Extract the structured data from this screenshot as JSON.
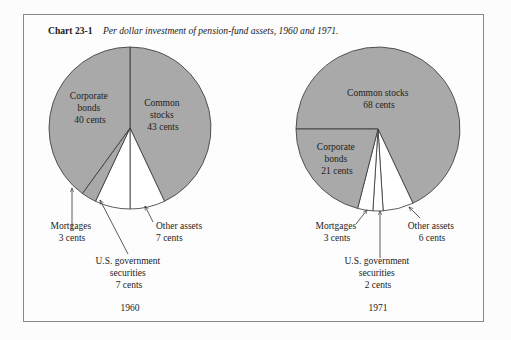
{
  "header": {
    "chart_number": "Chart 23-1",
    "caption": "Per dollar investment of pension-fund assets, 1960 and 1971."
  },
  "colors": {
    "shaded": "#a9a9a9",
    "unshaded": "#ffffff",
    "stroke": "#333333",
    "frame": "#888888"
  },
  "chart_data": [
    {
      "type": "pie",
      "title": "1960",
      "unit": "cents per dollar",
      "categories": [
        "Common stocks",
        "Other assets",
        "U.S. government securities",
        "Mortgages",
        "Corporate bonds"
      ],
      "values": [
        43,
        7,
        7,
        3,
        40
      ],
      "shaded": [
        true,
        false,
        false,
        true,
        true
      ],
      "labels": {
        "common_stocks": [
          "Common",
          "stocks",
          "43 cents"
        ],
        "corporate_bonds": [
          "Corporate",
          "bonds",
          "40 cents"
        ],
        "mortgages": [
          "Mortgages",
          "3 cents"
        ],
        "us_gov": [
          "U.S. government",
          "securities",
          "7 cents"
        ],
        "other_assets": [
          "Other assets",
          "7 cents"
        ]
      }
    },
    {
      "type": "pie",
      "title": "1971",
      "unit": "cents per dollar",
      "categories": [
        "Common stocks",
        "Other assets",
        "U.S. government securities",
        "Mortgages",
        "Corporate bonds"
      ],
      "values": [
        68,
        6,
        2,
        3,
        21
      ],
      "shaded": [
        true,
        false,
        false,
        false,
        true
      ],
      "labels": {
        "common_stocks": [
          "Common stocks",
          "68 cents"
        ],
        "corporate_bonds": [
          "Corporate",
          "bonds",
          "21 cents"
        ],
        "mortgages": [
          "Mortgages",
          "3 cents"
        ],
        "us_gov": [
          "U.S. government",
          "securities",
          "2 cents"
        ],
        "other_assets": [
          "Other assets",
          "6 cents"
        ]
      }
    }
  ]
}
